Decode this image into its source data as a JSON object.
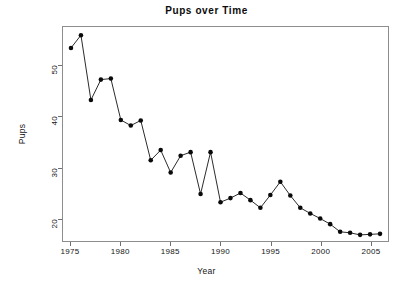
{
  "chart_data": {
    "type": "line",
    "title": "Pups over Time",
    "xlabel": "Year",
    "ylabel": "Pups",
    "grid": false,
    "legend": "none",
    "marker": "filled-circle",
    "linestyle": "solid-thin",
    "xlim": [
      1974.2,
      2006.8
    ],
    "ylim": [
      15.6,
      57.5
    ],
    "xticks": [
      1975,
      1980,
      1985,
      1990,
      1995,
      2000,
      2005
    ],
    "yticks": [
      20,
      30,
      40,
      50
    ],
    "xtick_labels": [
      "1975",
      "1980",
      "1985",
      "1990",
      "1995",
      "2000",
      "2005"
    ],
    "ytick_labels": [
      "20",
      "30",
      "40",
      "50"
    ],
    "x": [
      1975,
      1976,
      1977,
      1978,
      1979,
      1980,
      1981,
      1982,
      1983,
      1984,
      1985,
      1986,
      1987,
      1988,
      1989,
      1990,
      1991,
      1992,
      1993,
      1994,
      1995,
      1996,
      1997,
      1998,
      1999,
      2000,
      2001,
      2002,
      2003,
      2004,
      2005,
      2006
    ],
    "values": [
      53.4,
      55.9,
      43.2,
      47.2,
      47.4,
      39.3,
      38.2,
      39.2,
      31.4,
      33.4,
      29.0,
      32.3,
      33.0,
      24.8,
      33.0,
      23.2,
      24.0,
      25.0,
      23.6,
      22.1,
      24.6,
      27.2,
      24.5,
      22.1,
      21.0,
      20.0,
      18.9,
      17.4,
      17.2,
      16.8,
      16.9,
      17.0
    ],
    "series_name": "Pups"
  },
  "axes": {
    "title": "Pups over Time",
    "x_label": "Year",
    "y_label": "Pups"
  }
}
